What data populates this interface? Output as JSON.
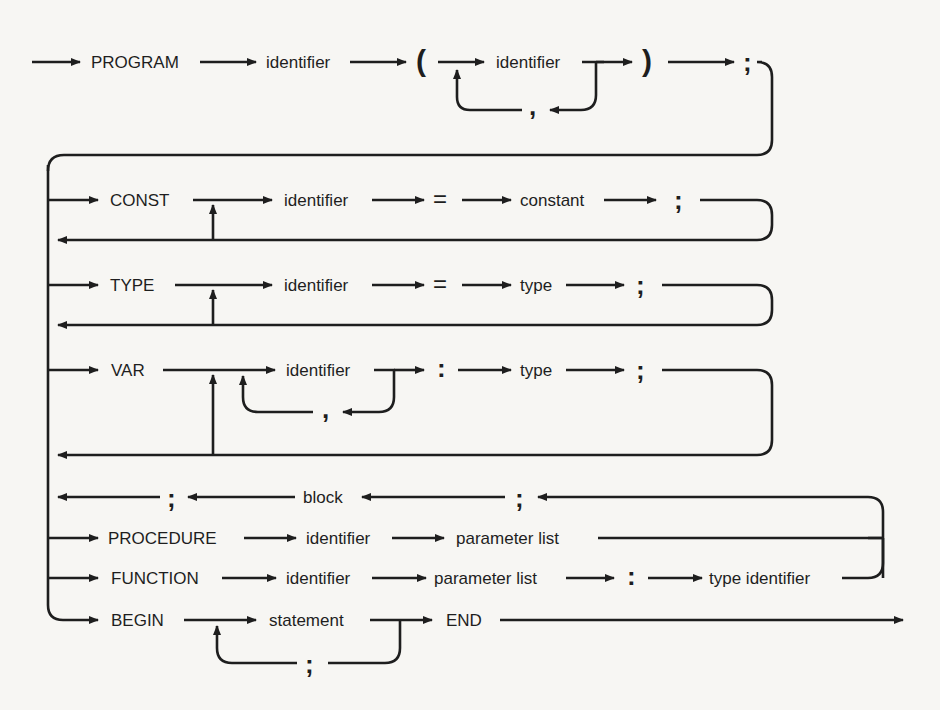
{
  "diagram": {
    "program_row": {
      "keyword": "PROGRAM",
      "identifier": "identifier",
      "open_paren": "(",
      "param_identifier": "identifier",
      "comma": ",",
      "close_paren": ")",
      "semicolon": ";"
    },
    "const_row": {
      "keyword": "CONST",
      "identifier": "identifier",
      "equals": "=",
      "value": "constant",
      "semicolon": ";"
    },
    "type_row": {
      "keyword": "TYPE",
      "identifier": "identifier",
      "equals": "=",
      "value": "type",
      "semicolon": ";"
    },
    "var_row": {
      "keyword": "VAR",
      "identifier": "identifier",
      "comma": ",",
      "colon": ":",
      "value": "type",
      "semicolon": ";"
    },
    "block_row": {
      "semicolon_left": ";",
      "block": "block",
      "semicolon_right": ";"
    },
    "procedure_row": {
      "keyword": "PROCEDURE",
      "identifier": "identifier",
      "params": "parameter list"
    },
    "function_row": {
      "keyword": "FUNCTION",
      "identifier": "identifier",
      "params": "parameter list",
      "colon": ":",
      "return_type": "type identifier"
    },
    "begin_row": {
      "keyword": "BEGIN",
      "statement": "statement",
      "semicolon": ";",
      "end_keyword": "END"
    },
    "colors": {
      "ink": "#1e1e1e",
      "paper": "#f7f6f3"
    }
  }
}
